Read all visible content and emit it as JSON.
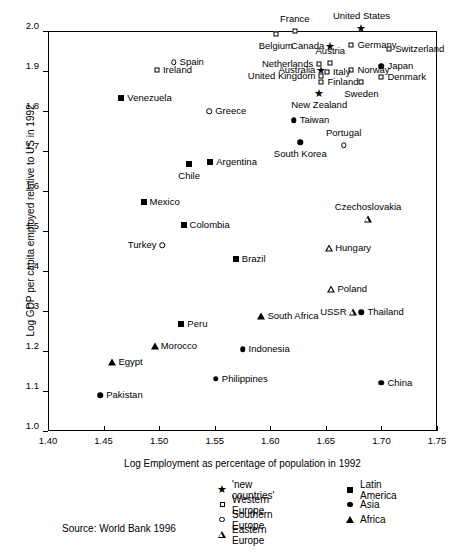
{
  "chart_data": {
    "type": "scatter",
    "title": "",
    "xlabel": "Log Employment as percentage of population in 1992",
    "ylabel": "Log GDP per capita employed relative to US in 1992",
    "xlim": [
      1.4,
      1.75
    ],
    "ylim": [
      1.0,
      2.0
    ],
    "xticks": [
      "1.40",
      "1.45",
      "1.50",
      "1.55",
      "1.60",
      "1.65",
      "1.70",
      "1.75"
    ],
    "xtick_values": [
      1.4,
      1.45,
      1.5,
      1.55,
      1.6,
      1.65,
      1.7,
      1.75
    ],
    "yticks": [
      "1.0",
      "1.1",
      "1.2",
      "1.3",
      "1.4",
      "1.5",
      "1.6",
      "1.7",
      "1.8",
      "1.9",
      "2.0"
    ],
    "ytick_values": [
      1.0,
      1.1,
      1.2,
      1.3,
      1.4,
      1.5,
      1.6,
      1.7,
      1.8,
      1.9,
      2.0
    ],
    "grid": false,
    "legend_position": "below-right",
    "source": "Source: World Bank 1996",
    "legend": [
      {
        "label": "'new countries'",
        "marker": "star"
      },
      {
        "label": "Western Europe",
        "marker": "open-square"
      },
      {
        "label": "Southern Europe",
        "marker": "open-circle"
      },
      {
        "label": "Eastern Europe",
        "marker": "open-triangle"
      },
      {
        "label": "Latin America",
        "marker": "filled-square"
      },
      {
        "label": "Asia",
        "marker": "filled-circle"
      },
      {
        "label": "Africa",
        "marker": "filled-triangle"
      }
    ],
    "points": [
      {
        "name": "France",
        "x": 1.622,
        "y": 2.0,
        "marker": "open-square",
        "label_pos": "t"
      },
      {
        "name": "Belgium",
        "x": 1.605,
        "y": 1.993,
        "marker": "open-square",
        "label_pos": "b"
      },
      {
        "name": "United States",
        "x": 1.682,
        "y": 2.007,
        "marker": "star",
        "label_pos": "t"
      },
      {
        "name": "Canada",
        "x": 1.654,
        "y": 1.962,
        "marker": "star",
        "label_pos": "l"
      },
      {
        "name": "Germany",
        "x": 1.673,
        "y": 1.965,
        "marker": "open-square",
        "label_pos": "r"
      },
      {
        "name": "Switzerland",
        "x": 1.707,
        "y": 1.955,
        "marker": "open-square",
        "label_pos": "r"
      },
      {
        "name": "Austria",
        "x": 1.654,
        "y": 1.92,
        "marker": "open-square",
        "label_pos": "t"
      },
      {
        "name": "Netherlands",
        "x": 1.644,
        "y": 1.917,
        "marker": "open-square",
        "label_pos": "l"
      },
      {
        "name": "Spain",
        "x": 1.513,
        "y": 1.922,
        "marker": "open-circle",
        "label_pos": "r"
      },
      {
        "name": "Japan",
        "x": 1.7,
        "y": 1.912,
        "marker": "filled-circle",
        "label_pos": "r"
      },
      {
        "name": "Australia",
        "x": 1.646,
        "y": 1.902,
        "marker": "star",
        "label_pos": "l"
      },
      {
        "name": "Norway",
        "x": 1.673,
        "y": 1.903,
        "marker": "open-square",
        "label_pos": "r"
      },
      {
        "name": "Italy",
        "x": 1.651,
        "y": 1.898,
        "marker": "open-square",
        "label_pos": "r"
      },
      {
        "name": "Ireland",
        "x": 1.498,
        "y": 1.903,
        "marker": "open-square",
        "label_pos": "r"
      },
      {
        "name": "United Kingdom",
        "x": 1.646,
        "y": 1.888,
        "marker": "open-square",
        "label_pos": "l"
      },
      {
        "name": "Denmark",
        "x": 1.7,
        "y": 1.884,
        "marker": "open-square",
        "label_pos": "r"
      },
      {
        "name": "Finland",
        "x": 1.646,
        "y": 1.873,
        "marker": "open-square",
        "label_pos": "r"
      },
      {
        "name": "Sweden",
        "x": 1.682,
        "y": 1.872,
        "marker": "open-square",
        "label_pos": "b"
      },
      {
        "name": "Venezuela",
        "x": 1.466,
        "y": 1.833,
        "marker": "filled-square",
        "label_pos": "r"
      },
      {
        "name": "New Zealand",
        "x": 1.644,
        "y": 1.845,
        "marker": "star",
        "label_pos": "b"
      },
      {
        "name": "Greece",
        "x": 1.545,
        "y": 1.8,
        "marker": "open-circle",
        "label_pos": "r"
      },
      {
        "name": "Taiwan",
        "x": 1.621,
        "y": 1.777,
        "marker": "filled-circle",
        "label_pos": "r"
      },
      {
        "name": "Portugal",
        "x": 1.666,
        "y": 1.715,
        "marker": "open-circle",
        "label_pos": "t"
      },
      {
        "name": "South Korea",
        "x": 1.627,
        "y": 1.722,
        "marker": "filled-circle",
        "label_pos": "b"
      },
      {
        "name": "Argentina",
        "x": 1.546,
        "y": 1.672,
        "marker": "filled-square",
        "label_pos": "r"
      },
      {
        "name": "Chile",
        "x": 1.527,
        "y": 1.668,
        "marker": "filled-square",
        "label_pos": "b"
      },
      {
        "name": "Mexico",
        "x": 1.486,
        "y": 1.573,
        "marker": "filled-square",
        "label_pos": "r"
      },
      {
        "name": "Czechoslovakia",
        "x": 1.688,
        "y": 1.53,
        "marker": "open-triangle",
        "label_pos": "t"
      },
      {
        "name": "Colombia",
        "x": 1.522,
        "y": 1.515,
        "marker": "filled-square",
        "label_pos": "r"
      },
      {
        "name": "Turkey",
        "x": 1.503,
        "y": 1.465,
        "marker": "open-circle",
        "label_pos": "l"
      },
      {
        "name": "Hungary",
        "x": 1.653,
        "y": 1.458,
        "marker": "open-triangle",
        "label_pos": "r"
      },
      {
        "name": "Brazil",
        "x": 1.569,
        "y": 1.43,
        "marker": "filled-square",
        "label_pos": "r"
      },
      {
        "name": "Poland",
        "x": 1.655,
        "y": 1.355,
        "marker": "open-triangle",
        "label_pos": "r"
      },
      {
        "name": "USSR",
        "x": 1.674,
        "y": 1.298,
        "marker": "open-triangle",
        "label_pos": "l"
      },
      {
        "name": "Thailand",
        "x": 1.682,
        "y": 1.297,
        "marker": "filled-circle",
        "label_pos": "r"
      },
      {
        "name": "South Africa",
        "x": 1.592,
        "y": 1.288,
        "marker": "filled-triangle",
        "label_pos": "r"
      },
      {
        "name": "Peru",
        "x": 1.52,
        "y": 1.268,
        "marker": "filled-square",
        "label_pos": "r"
      },
      {
        "name": "Morocco",
        "x": 1.496,
        "y": 1.212,
        "marker": "filled-triangle",
        "label_pos": "r"
      },
      {
        "name": "Indonesia",
        "x": 1.575,
        "y": 1.205,
        "marker": "filled-circle",
        "label_pos": "r"
      },
      {
        "name": "Egypt",
        "x": 1.458,
        "y": 1.173,
        "marker": "filled-triangle",
        "label_pos": "r"
      },
      {
        "name": "Philippines",
        "x": 1.551,
        "y": 1.131,
        "marker": "filled-circle",
        "label_pos": "r"
      },
      {
        "name": "China",
        "x": 1.7,
        "y": 1.121,
        "marker": "filled-circle",
        "label_pos": "r"
      },
      {
        "name": "Pakistan",
        "x": 1.447,
        "y": 1.09,
        "marker": "filled-circle",
        "label_pos": "r"
      }
    ]
  }
}
